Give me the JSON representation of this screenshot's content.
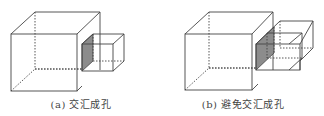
{
  "panels": [
    {
      "label": "(a)",
      "caption": "(a) 交汇成孔"
    },
    {
      "label": "(b)",
      "caption": "(b) 避免交汇成孔"
    }
  ],
  "colors": {
    "line": "#444444",
    "shade": "#8c8c8c"
  }
}
